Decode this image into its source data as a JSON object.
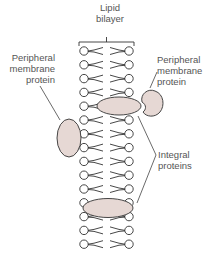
{
  "labels": {
    "lipid_bilayer": [
      "Lipid",
      "bilayer"
    ],
    "peripheral_left": [
      "Peripheral",
      "membrane",
      "protein"
    ],
    "peripheral_right": [
      "Peripheral",
      "membrane",
      "protein"
    ],
    "integral": [
      "Integral",
      "proteins"
    ]
  },
  "colors": {
    "protein_fill": "#e6d8d4",
    "line": "#333333",
    "text": "#555555"
  },
  "bilayer": {
    "rows": 15
  }
}
